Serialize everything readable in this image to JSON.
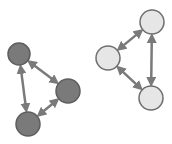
{
  "colors": {
    "background": "#ffffff",
    "dark_fill": "#7a7a7a",
    "dark_stroke": "#5e5e5e",
    "light_fill": "#e6e6e6",
    "light_stroke": "#6e6e6e",
    "arrow": "#7a7a7a"
  },
  "groups": [
    {
      "name": "dark-triangle",
      "nodes": [
        {
          "id": "d1",
          "cx": 19,
          "cy": 54,
          "r": 11
        },
        {
          "id": "d2",
          "cx": 68,
          "cy": 91,
          "r": 12
        },
        {
          "id": "d3",
          "cx": 28,
          "cy": 124,
          "r": 12
        }
      ],
      "edges": [
        [
          "d1",
          "d2"
        ],
        [
          "d2",
          "d3"
        ],
        [
          "d1",
          "d3"
        ]
      ]
    },
    {
      "name": "light-triangle",
      "nodes": [
        {
          "id": "l1",
          "cx": 152,
          "cy": 22,
          "r": 12
        },
        {
          "id": "l2",
          "cx": 108,
          "cy": 58,
          "r": 12
        },
        {
          "id": "l3",
          "cx": 151,
          "cy": 98,
          "r": 12
        }
      ],
      "edges": [
        [
          "l1",
          "l2"
        ],
        [
          "l2",
          "l3"
        ],
        [
          "l1",
          "l3"
        ]
      ]
    }
  ]
}
